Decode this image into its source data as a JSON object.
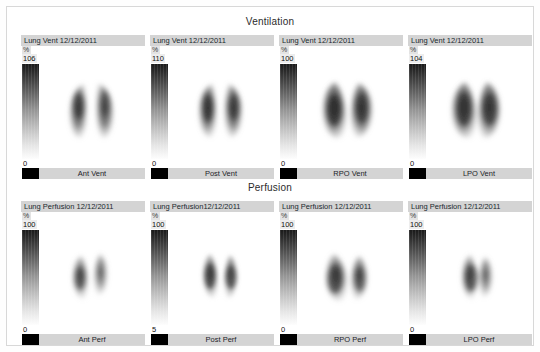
{
  "sections": [
    {
      "title": "Ventilation"
    },
    {
      "title": "Perfusion"
    }
  ],
  "units_symbol": "%",
  "ventilation": {
    "title": "Ventilation",
    "panels": [
      {
        "header": "Lung Vent 12/12/2011",
        "unit": "%",
        "max": "106",
        "min": "0",
        "caption": "Ant Vent",
        "view": "anterior"
      },
      {
        "header": "Lung Vent 12/12/2011",
        "unit": "%",
        "max": "110",
        "min": "0",
        "caption": "Post Vent",
        "view": "posterior"
      },
      {
        "header": "Lung Vent 12/12/2011",
        "unit": "%",
        "max": "100",
        "min": "0",
        "caption": "RPO Vent",
        "view": "rpo"
      },
      {
        "header": "Lung Vent 12/12/2011",
        "unit": "%",
        "max": "104",
        "min": "0",
        "caption": "LPO Vent",
        "view": "lpo"
      }
    ]
  },
  "perfusion": {
    "title": "Perfusion",
    "panels": [
      {
        "header": "Lung Perfusion 12/12/2011",
        "unit": "%",
        "max": "100",
        "min": "0",
        "caption": "Ant Perf",
        "view": "anterior"
      },
      {
        "header": "Lung Perfusion12/12/2011",
        "unit": "%",
        "max": "100",
        "min": "5",
        "caption": "Post Perf",
        "view": "posterior"
      },
      {
        "header": "Lung Perfusion 12/12/2011",
        "unit": "%",
        "max": "100",
        "min": "0",
        "caption": "RPO Perf",
        "view": "rpo"
      },
      {
        "header": "Lung Perfusion 12/12/2011",
        "unit": "%",
        "max": "100",
        "min": "0",
        "caption": "LPO Perf",
        "view": "lpo"
      }
    ]
  },
  "colors": {
    "header_bar": "#d4d4d4",
    "caption_bar": "#d4d4d4",
    "swatch": "#000000",
    "colorbar_high": "#1a1a1a",
    "colorbar_low": "#ffffff",
    "frame_border": "#d8d8d8",
    "page_background": "#ffffff"
  }
}
